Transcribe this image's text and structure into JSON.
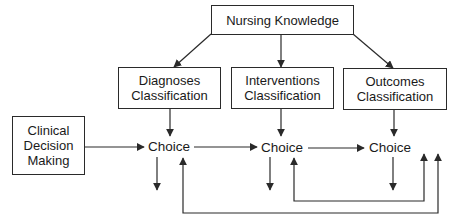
{
  "diagram": {
    "nodes": {
      "nursing_knowledge": "Nursing Knowledge",
      "diagnoses": {
        "line1": "Diagnoses",
        "line2": "Classification"
      },
      "interventions": {
        "line1": "Interventions",
        "line2": "Classification"
      },
      "outcomes": {
        "line1": "Outcomes",
        "line2": "Classification"
      },
      "clinical": {
        "line1": "Clinical",
        "line2": "Decision",
        "line3": "Making"
      },
      "choice_1": "Choice",
      "choice_2": "Choice",
      "choice_3": "Choice"
    },
    "edges": [
      {
        "from": "Nursing Knowledge",
        "to": "Diagnoses Classification"
      },
      {
        "from": "Nursing Knowledge",
        "to": "Interventions Classification"
      },
      {
        "from": "Nursing Knowledge",
        "to": "Outcomes Classification"
      },
      {
        "from": "Diagnoses Classification",
        "to": "Choice 1"
      },
      {
        "from": "Interventions Classification",
        "to": "Choice 2"
      },
      {
        "from": "Outcomes Classification",
        "to": "Choice 3"
      },
      {
        "from": "Clinical Decision Making",
        "to": "Choice 1"
      },
      {
        "from": "Choice 1",
        "to": "Choice 2"
      },
      {
        "from": "Choice 2",
        "to": "Choice 3"
      },
      {
        "from": "Choice 1",
        "to": "down (outcome)"
      },
      {
        "from": "Choice 2",
        "to": "down (outcome)"
      },
      {
        "from": "Choice 3",
        "to": "down (outcome)"
      },
      {
        "from": "feedback loop (inner)",
        "to": "Choice 2"
      },
      {
        "from": "feedback loop (outer)",
        "to": "Choice 1"
      }
    ],
    "colors": {
      "line": "#2a2a2a",
      "background": "#ffffff"
    }
  }
}
